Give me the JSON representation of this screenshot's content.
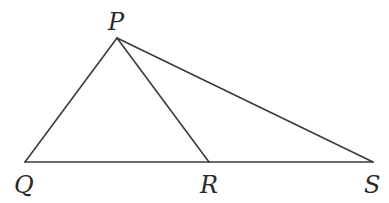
{
  "diagram": {
    "type": "geometry-triangle",
    "stroke_color": "#3a3a3a",
    "points": {
      "P": {
        "label": "P",
        "x": 117,
        "y": 38,
        "label_x": 108,
        "label_y": 30
      },
      "Q": {
        "label": "Q",
        "x": 25,
        "y": 162,
        "label_x": 15,
        "label_y": 193
      },
      "R": {
        "label": "R",
        "x": 209,
        "y": 162,
        "label_x": 200,
        "label_y": 193
      },
      "S": {
        "label": "S",
        "x": 373,
        "y": 162,
        "label_x": 364,
        "label_y": 193
      }
    },
    "segments": [
      {
        "from": "P",
        "to": "Q"
      },
      {
        "from": "P",
        "to": "R"
      },
      {
        "from": "P",
        "to": "S"
      },
      {
        "from": "Q",
        "to": "S"
      }
    ]
  }
}
